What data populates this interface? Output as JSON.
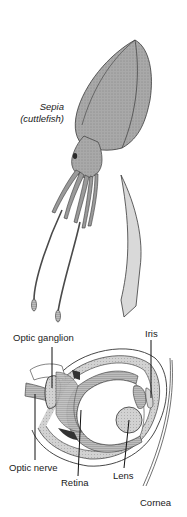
{
  "figure": {
    "organism": {
      "genus": "Sepia",
      "common_name": "(cuttlefish)"
    },
    "eye_labels": {
      "optic_ganglion": "Optic ganglion",
      "iris": "Iris",
      "optic_nerve": "Optic nerve",
      "retina": "Retina",
      "lens": "Lens",
      "cornea": "Cornea"
    },
    "colors": {
      "body_fill": "#a8a8a8",
      "body_dark": "#5a5a5a",
      "line": "#1a1a1a",
      "lens_fill": "#c8c8c8",
      "background": "#ffffff"
    }
  }
}
